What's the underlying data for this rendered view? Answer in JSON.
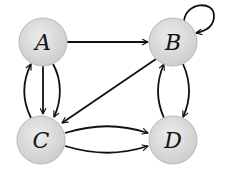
{
  "diagram": {
    "type": "directed-graph",
    "colors": {
      "node_fill_center": "#ececec",
      "node_fill_edge": "#cfcfcf",
      "node_stroke": "#b8b8b8",
      "edge": "#111111",
      "label": "#151515",
      "background": "#ffffff"
    },
    "nodes": [
      {
        "id": "A",
        "label": "A",
        "cx": 43,
        "cy": 42,
        "r": 24
      },
      {
        "id": "B",
        "label": "B",
        "cx": 173,
        "cy": 42,
        "r": 24
      },
      {
        "id": "C",
        "label": "C",
        "cx": 41,
        "cy": 140,
        "r": 24
      },
      {
        "id": "D",
        "label": "D",
        "cx": 173,
        "cy": 140,
        "r": 24
      }
    ],
    "edges": [
      {
        "from": "A",
        "to": "B",
        "shape": "straight"
      },
      {
        "from": "B",
        "to": "B",
        "shape": "self-loop"
      },
      {
        "from": "B",
        "to": "C",
        "shape": "straight"
      },
      {
        "from": "A",
        "to": "C",
        "shape": "straight"
      },
      {
        "from": "A",
        "to": "C",
        "shape": "curved-right"
      },
      {
        "from": "C",
        "to": "A",
        "shape": "curved-left"
      },
      {
        "from": "C",
        "to": "D",
        "shape": "curved-up"
      },
      {
        "from": "C",
        "to": "D",
        "shape": "curved-down"
      },
      {
        "from": "B",
        "to": "D",
        "shape": "curved-right"
      },
      {
        "from": "D",
        "to": "B",
        "shape": "curved-left"
      }
    ]
  }
}
